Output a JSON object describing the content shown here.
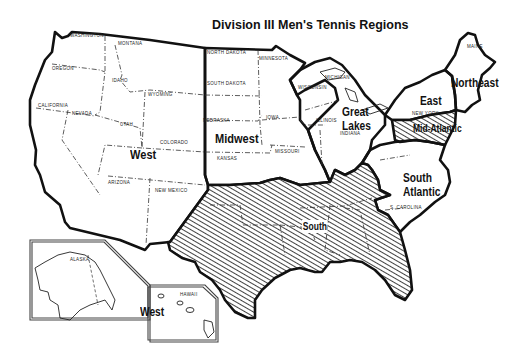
{
  "map": {
    "title": "Division III Men's Tennis Regions",
    "colors": {
      "background": "#ffffff",
      "ink": "#111111",
      "hatch": "#111111"
    },
    "regions": [
      {
        "name": "West",
        "label": "West",
        "hatched": false
      },
      {
        "name": "Midwest",
        "label": "Midwest",
        "hatched": false
      },
      {
        "name": "Great Lakes",
        "label_line1": "Great",
        "label_line2": "Lakes",
        "hatched": false
      },
      {
        "name": "East",
        "label": "East",
        "hatched": false
      },
      {
        "name": "Northeast",
        "label": "Northeast",
        "hatched": false
      },
      {
        "name": "Mid-Atlantic",
        "label": "Mid-Atlantic",
        "hatched": true
      },
      {
        "name": "South Atlantic",
        "label_line1": "South",
        "label_line2": "Atlantic",
        "hatched": false
      },
      {
        "name": "South",
        "label": "South",
        "hatched": true
      }
    ],
    "inset": {
      "label": "West",
      "alaska_label": "ALASKA",
      "hawaii_label": "HAWAII"
    },
    "state_labels": {
      "washington": "WASHINGTON",
      "oregon": "OREGON",
      "california": "CALIFORNIA",
      "nevada": "NEVADA",
      "idaho": "IDAHO",
      "montana": "MONTANA",
      "wyoming": "WYOMING",
      "utah": "UTAH",
      "colorado": "COLORADO",
      "arizona": "ARIZONA",
      "new_mexico": "NEW MEXICO",
      "north_dakota": "NORTH DAKOTA",
      "south_dakota": "SOUTH DAKOTA",
      "nebraska": "NEBRASKA",
      "kansas": "KANSAS",
      "minnesota": "MINNESOTA",
      "iowa": "IOWA",
      "missouri": "MISSOURI",
      "wisconsin": "WISCONSIN",
      "illinois": "ILLINOIS",
      "michigan": "MICHIGAN",
      "indiana": "INDIANA",
      "new_york": "NEW YORK",
      "maine": "MAINE",
      "s_carolina": "S. CAROLINA"
    }
  }
}
